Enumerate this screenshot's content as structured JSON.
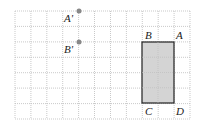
{
  "grid": {
    "cols": 11,
    "rows": 7,
    "x0": 15,
    "y0": 11,
    "x1": 190,
    "y1": 119,
    "line_color": "#bbbbbb"
  },
  "rectangle": {
    "x": 142,
    "y": 42,
    "w": 32,
    "h": 61,
    "fill": "#d4d4d4",
    "stroke": "#222222"
  },
  "points": [
    {
      "name": "A'",
      "x": 79,
      "y": 11,
      "color": "#888888"
    },
    {
      "name": "B'",
      "x": 79,
      "y": 42,
      "color": "#888888"
    }
  ],
  "labels": {
    "a_prime": "A'",
    "b_prime": "B'",
    "a": "A",
    "b": "B",
    "c": "C",
    "d": "D"
  }
}
